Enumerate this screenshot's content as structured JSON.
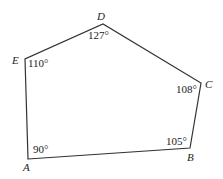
{
  "diagram": {
    "type": "pentagon",
    "stroke_color": "#333333",
    "background": "#ffffff",
    "vertices": [
      {
        "name": "A",
        "x": 28,
        "y": 159,
        "angle": "90°"
      },
      {
        "name": "B",
        "x": 190,
        "y": 148,
        "angle": "105°"
      },
      {
        "name": "C",
        "x": 201,
        "y": 83,
        "angle": "108°"
      },
      {
        "name": "D",
        "x": 103,
        "y": 24,
        "angle": "127°"
      },
      {
        "name": "E",
        "x": 25,
        "y": 59,
        "angle": "110°"
      }
    ],
    "labels": {
      "A": "A",
      "B": "B",
      "C": "C",
      "D": "D",
      "E": "E"
    },
    "angles": {
      "A": "90°",
      "B": "105°",
      "C": "108°",
      "D": "127°",
      "E": "110°"
    }
  }
}
